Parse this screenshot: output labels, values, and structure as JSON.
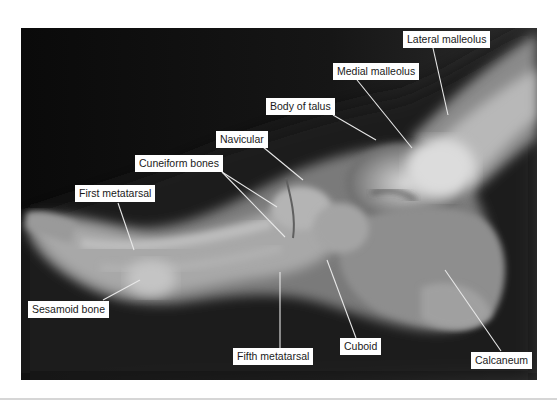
{
  "figure": {
    "type": "lateral foot radiograph",
    "background_color": "#0c0c0c",
    "label_background": "#ffffff",
    "leader_color": "#e8e8e8",
    "labels": [
      {
        "id": "lateral-malleolus",
        "text": "Lateral malleolus"
      },
      {
        "id": "medial-malleolus",
        "text": "Medial malleolus"
      },
      {
        "id": "body-of-talus",
        "text": "Body of talus"
      },
      {
        "id": "navicular",
        "text": "Navicular"
      },
      {
        "id": "cuneiform-bones",
        "text": "Cuneiform bones"
      },
      {
        "id": "first-metatarsal",
        "text": "First metatarsal"
      },
      {
        "id": "sesamoid-bone",
        "text": "Sesamoid bone"
      },
      {
        "id": "fifth-metatarsal",
        "text": "Fifth metatarsal"
      },
      {
        "id": "cuboid",
        "text": "Cuboid"
      },
      {
        "id": "calcaneum",
        "text": "Calcaneum"
      }
    ]
  }
}
